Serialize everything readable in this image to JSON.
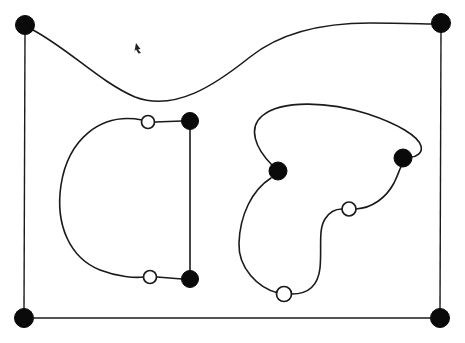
{
  "figure": {
    "title": "Knot diagram with black and white vertices",
    "width": 465,
    "height": 343,
    "background_color": "#ffffff",
    "stroke_color": "#1a1a1a",
    "filled_node_color": "#0a0a0a",
    "hollow_node_fill": "#ffffff",
    "edge_stroke_width": 1.6,
    "frame_stroke_width": 1.4
  },
  "nodes": {
    "filled": [
      {
        "id": "corner-top-left",
        "label": "black-vertex-1",
        "x": 25,
        "y": 25,
        "r": 9.5
      },
      {
        "id": "corner-top-right",
        "label": "black-vertex-2",
        "x": 441,
        "y": 23,
        "r": 9.5
      },
      {
        "id": "corner-bottom-left",
        "label": "black-vertex-3",
        "x": 24,
        "y": 318,
        "r": 9.5
      },
      {
        "id": "corner-bottom-right",
        "label": "black-vertex-4",
        "x": 440,
        "y": 318,
        "r": 9.5
      },
      {
        "id": "left-upper-black",
        "label": "black-vertex-5",
        "x": 190,
        "y": 121,
        "r": 8.5
      },
      {
        "id": "left-lower-black",
        "label": "black-vertex-6",
        "x": 190,
        "y": 279,
        "r": 8.5
      },
      {
        "id": "right-left-black",
        "label": "black-vertex-7",
        "x": 278,
        "y": 171,
        "r": 9.0
      },
      {
        "id": "right-right-black",
        "label": "black-vertex-8",
        "x": 403,
        "y": 158,
        "r": 9.0
      }
    ],
    "hollow": [
      {
        "id": "left-upper-white",
        "label": "white-vertex-1",
        "x": 148,
        "y": 122,
        "r": 6.5
      },
      {
        "id": "left-lower-white",
        "label": "white-vertex-2",
        "x": 150,
        "y": 277,
        "r": 6.5
      },
      {
        "id": "right-mid-white",
        "label": "white-vertex-3",
        "x": 349,
        "y": 209,
        "r": 7.0
      },
      {
        "id": "right-lower-white",
        "label": "white-vertex-4",
        "x": 284,
        "y": 294,
        "r": 7.5
      }
    ]
  },
  "edges": {
    "frame_left": {
      "name": "left-frame-segment",
      "d": "M 25 34 L 24 309"
    },
    "frame_right": {
      "name": "right-frame-segment",
      "d": "M 441 32 L 440 309"
    },
    "frame_bottom": {
      "name": "bottom-frame-segment",
      "d": "M 34 318 L 431 318"
    },
    "top_curve": {
      "name": "top-sweeping-curve",
      "d": "M 33 30 C 70 50 100 82 135 97 C 175 112 215 85 250 57 C 285 29 330 23 370 23 C 400 23 425 24 432 24"
    },
    "left_loop_arc": {
      "name": "left-open-arc",
      "d": "M 142 120 C 100 112 68 140 61 185 C 55 225 70 258 100 270 C 118 277 135 278 144 277"
    },
    "left_upper_link": {
      "name": "left-upper-connector",
      "d": "M 155 122 L 182 121"
    },
    "left_lower_link": {
      "name": "left-lower-connector",
      "d": "M 157 277 L 182 279"
    },
    "left_vertical": {
      "name": "left-vertical-connector",
      "d": "M 190 130 L 190 271"
    },
    "right_top_arc": {
      "name": "right-top-arc",
      "d": "M 272 165 C 255 148 248 128 262 116 C 282 99 330 102 368 114 C 398 124 418 136 421 146 C 423 153 416 157 411 157"
    },
    "right_left_arc": {
      "name": "right-left-lower-arc",
      "d": "M 271 178 C 252 190 240 215 239 243 C 238 268 258 288 278 293"
    },
    "right_s_curve": {
      "name": "right-s-curve",
      "d": "M 292 294 C 308 294 318 286 320 268 C 322 248 318 230 325 219 C 330 211 337 209 342 209"
    },
    "right_right_arc": {
      "name": "right-right-connector",
      "d": "M 356 209 C 372 208 386 198 394 183 C 398 175 400 168 401 167"
    }
  },
  "cursor": {
    "name": "mouse-cursor-mark",
    "x": 139,
    "y": 48,
    "visible": true
  }
}
